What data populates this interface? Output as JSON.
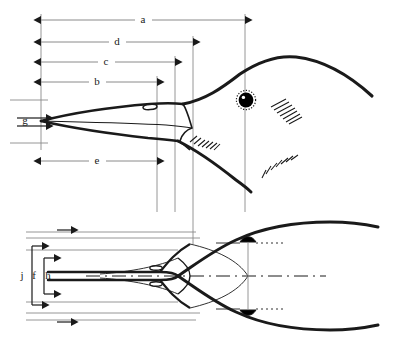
{
  "figure": {
    "views": [
      {
        "id": "lateral",
        "name": "lateral-view",
        "description": "Side profile of bird head and bill"
      },
      {
        "id": "dorsal",
        "name": "dorsal-view",
        "description": "Top-down view of bird head and bill"
      }
    ],
    "background_color": "#ffffff",
    "line_color": "#1a1a1a",
    "dimension_line_color": "#808080",
    "eye_color": "#000000"
  },
  "measurements": [
    {
      "key": "a",
      "label": "a",
      "view": "lateral",
      "orientation": "horizontal",
      "label_x": 143,
      "label_y": 20,
      "x1": 41,
      "x2": 245,
      "y": 20
    },
    {
      "key": "d",
      "label": "d",
      "view": "lateral",
      "orientation": "horizontal",
      "label_x": 117,
      "label_y": 42,
      "x1": 41,
      "x2": 193,
      "y": 42
    },
    {
      "key": "c",
      "label": "c",
      "view": "lateral",
      "orientation": "horizontal",
      "label_x": 106,
      "label_y": 62,
      "x1": 41,
      "x2": 175,
      "y": 62
    },
    {
      "key": "b",
      "label": "b",
      "view": "lateral",
      "orientation": "horizontal",
      "label_x": 97,
      "label_y": 82,
      "x1": 41,
      "x2": 157,
      "y": 82
    },
    {
      "key": "g",
      "label": "g",
      "view": "lateral",
      "orientation": "vertical",
      "label_x": 25,
      "label_y": 121,
      "y1": 100,
      "y2": 143,
      "x": 17
    },
    {
      "key": "e",
      "label": "e",
      "view": "lateral",
      "orientation": "horizontal",
      "label_x": 97,
      "label_y": 161,
      "x1": 41,
      "x2": 157,
      "y": 161
    },
    {
      "key": "j",
      "label": "j",
      "view": "dorsal",
      "orientation": "vertical",
      "label_x": 22,
      "label_y": 276,
      "y1": 238,
      "y2": 313,
      "x": 32
    },
    {
      "key": "f",
      "label": "f",
      "view": "dorsal",
      "orientation": "vertical",
      "label_x": 34,
      "label_y": 276,
      "y1": 250,
      "y2": 302,
      "x": 44
    },
    {
      "key": "h",
      "label": "h",
      "view": "dorsal",
      "orientation": "vertical",
      "label_x": 48,
      "label_y": 276,
      "y1": 232,
      "y2": 320,
      "x": 57
    }
  ],
  "anatomy": {
    "lateral": {
      "bill_tip": "bill-tip",
      "nostril": "nostril",
      "eye": "eye",
      "crown": "crown-outline",
      "gape": "gape-line",
      "lower_mandible": "lower-mandible",
      "feather_hatching": "feather-hatching"
    },
    "dorsal": {
      "bill_tip": "bill-tip",
      "nostrils": "nostril-pair",
      "eyes": "eye-pair",
      "centerline": "centerline-axis",
      "head_outline": "head-outline"
    }
  },
  "reference_lines": {
    "vertical_x": [
      41,
      157,
      175,
      193,
      245
    ],
    "note": "projection lines linking lateral and dorsal views"
  }
}
